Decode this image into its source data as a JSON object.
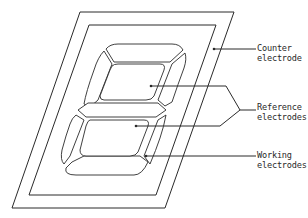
{
  "diagram": {
    "type": "seven-segment electrochromic display electrode layout",
    "labels": [
      {
        "id": "counter",
        "line1": "Counter",
        "line2": "electrode"
      },
      {
        "id": "reference",
        "line1": "Reference",
        "line2": "electrodes"
      },
      {
        "id": "working",
        "line1": "Working",
        "line2": "electrodes"
      }
    ],
    "colors": {
      "stroke": "#2a2a2a",
      "background": "#ffffff"
    }
  }
}
